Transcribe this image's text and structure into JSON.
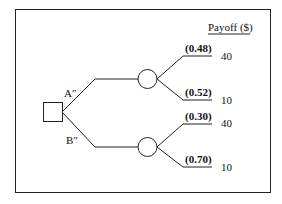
{
  "diagram": {
    "type": "decision-tree",
    "header": "Payoff ($)",
    "decision_node": {
      "shape": "square"
    },
    "alternatives": [
      {
        "label": "A″",
        "chance_node": {
          "shape": "circle"
        },
        "outcomes": [
          {
            "probability": "(0.48)",
            "payoff": "40"
          },
          {
            "probability": "(0.52)",
            "payoff": "10"
          }
        ]
      },
      {
        "label": "B″",
        "chance_node": {
          "shape": "circle"
        },
        "outcomes": [
          {
            "probability": "(0.30)",
            "payoff": "40"
          },
          {
            "probability": "(0.70)",
            "payoff": "10"
          }
        ]
      }
    ]
  }
}
